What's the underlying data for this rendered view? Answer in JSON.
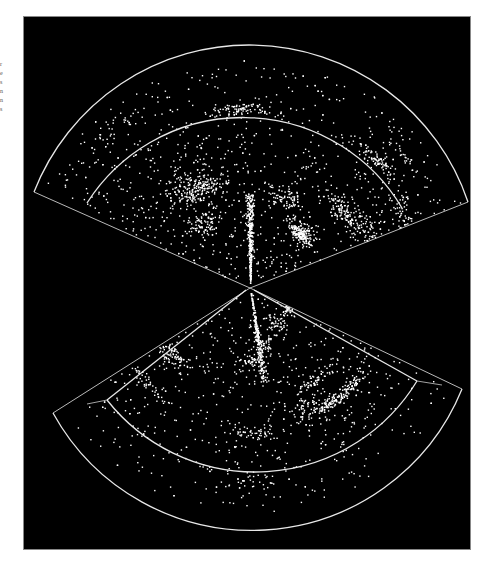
{
  "figure": {
    "panel": {
      "x": 23,
      "y": 16,
      "width": 448,
      "height": 534,
      "background": "#000000"
    },
    "colors": {
      "points": "#ffffff",
      "boundaries": "#e8e8e8"
    },
    "apex": {
      "x": 250,
      "y": 288
    },
    "upper_wedge": {
      "outer_radius": 231,
      "inner_radius": 185,
      "left_tip": {
        "x": 34,
        "y": 192
      },
      "right_tip": {
        "x": 468,
        "y": 202
      },
      "inner_left_end": {
        "x": 87,
        "y": 203
      },
      "inner_right_end": {
        "x": 402,
        "y": 208
      },
      "point_count": 2600
    },
    "lower_wedge": {
      "outer_radius": 227,
      "inner_radius": 189,
      "left_tip": {
        "x": 53,
        "y": 413
      },
      "right_tip": {
        "x": 462,
        "y": 389
      },
      "inner_left_corner": {
        "x": 107,
        "y": 400
      },
      "inner_right_corner": {
        "x": 417,
        "y": 381
      },
      "point_count": 1700
    }
  },
  "margin_text": {
    "lines": [
      "r",
      "e",
      "s",
      "",
      "n",
      "",
      "",
      "",
      "",
      "n",
      "s"
    ]
  }
}
